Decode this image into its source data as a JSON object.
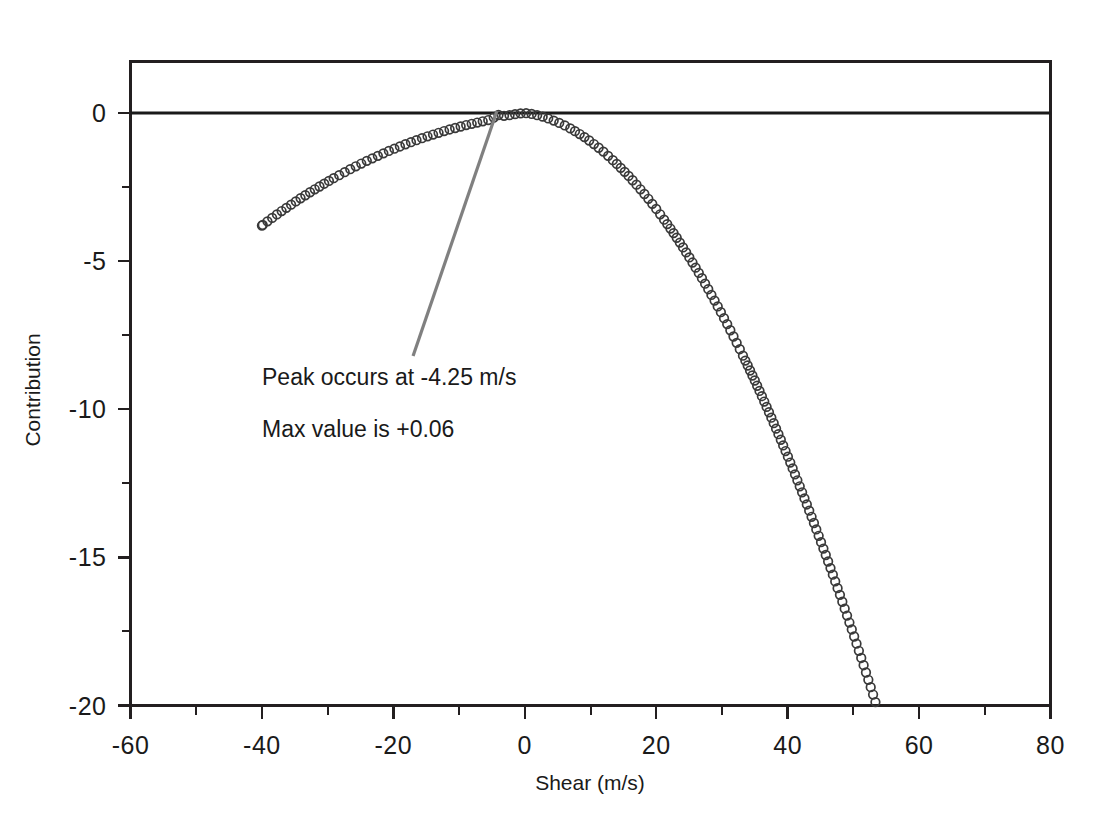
{
  "chart_data": {
    "type": "scatter",
    "title": "",
    "xlabel": "Shear (m/s)",
    "ylabel": "Contribution",
    "xlim": [
      -60,
      80
    ],
    "ylim": [
      -20,
      0.8
    ],
    "grid": false,
    "legend": null,
    "x_ticks": [
      -60,
      -40,
      -20,
      0,
      20,
      40,
      60,
      80
    ],
    "x_tick_labels": [
      "-60",
      "-40",
      "-20",
      "0",
      "20",
      "40",
      "60",
      "80"
    ],
    "x_minor_step": 10,
    "y_ticks": [
      0,
      -5,
      -10,
      -15,
      -20
    ],
    "y_tick_labels": [
      "0",
      "-5",
      "-10",
      "-15",
      "-20"
    ],
    "y_minor_step": 2.5,
    "marker_style": "open-circle",
    "series": [
      {
        "name": "Contribution",
        "x": [
          -40.0,
          -39.0,
          -38.0,
          -37.0,
          -36.0,
          -35.0,
          -34.0,
          -33.0,
          -32.0,
          -31.0,
          -30.0,
          -29.0,
          -28.0,
          -27.0,
          -26.0,
          -25.0,
          -24.0,
          -23.0,
          -22.0,
          -21.0,
          -20.0,
          -19.0,
          -18.0,
          -17.0,
          -16.0,
          -15.0,
          -14.0,
          -13.0,
          -12.0,
          -11.0,
          -10.0,
          -9.0,
          -8.0,
          -7.0,
          -6.0,
          -5.0,
          -4.25,
          -3.0,
          -2.0,
          -1.0,
          0.0,
          1.0,
          2.0,
          3.0,
          4.0,
          5.0,
          6.0,
          7.0,
          8.0,
          9.0,
          10.0,
          11.0,
          12.0,
          13.0,
          14.0,
          15.0,
          16.0,
          17.0,
          18.0,
          19.0,
          20.0,
          21.0,
          22.0,
          23.0,
          24.0,
          25.0,
          26.0,
          27.0,
          28.0,
          29.0,
          30.0,
          31.0,
          32.0,
          33.0,
          34.0,
          35.0,
          36.0,
          37.0,
          38.0,
          39.0,
          40.0,
          41.0,
          42.0,
          43.0,
          44.0,
          45.0,
          46.0,
          47.0,
          48.0,
          49.0,
          50.0,
          51.0,
          52.0,
          53.0,
          54.0,
          55.0,
          56.0,
          57.0,
          58.0,
          59.0,
          60.0,
          61.0,
          62.0,
          63.0,
          64.0,
          65.0,
          66.0,
          67.0,
          68.0,
          69.0,
          70.0,
          71.0
        ],
        "y": [
          -3.8,
          -3.63,
          -3.47,
          -3.31,
          -3.16,
          -3.01,
          -2.86,
          -2.72,
          -2.58,
          -2.45,
          -2.32,
          -2.19,
          -2.07,
          -1.95,
          -1.83,
          -1.72,
          -1.61,
          -1.51,
          -1.41,
          -1.31,
          -1.22,
          -1.13,
          -1.04,
          -0.96,
          -0.88,
          -0.8,
          -0.73,
          -0.66,
          -0.59,
          -0.53,
          -0.47,
          -0.41,
          -0.36,
          -0.31,
          -0.26,
          -0.21,
          -0.06,
          -0.1,
          -0.06,
          -0.02,
          0.0,
          -0.03,
          -0.08,
          -0.14,
          -0.22,
          -0.31,
          -0.41,
          -0.53,
          -0.66,
          -0.8,
          -0.96,
          -1.13,
          -1.31,
          -1.51,
          -1.72,
          -1.94,
          -2.17,
          -2.42,
          -2.68,
          -2.95,
          -3.24,
          -3.54,
          -3.85,
          -4.17,
          -4.51,
          -4.86,
          -5.22,
          -5.59,
          -5.98,
          -6.38,
          -6.79,
          -7.21,
          -7.65,
          -8.1,
          -8.56,
          -9.03,
          -9.52,
          -10.02,
          -10.53,
          -11.05,
          -11.58,
          -12.13,
          -12.69,
          -13.26,
          -13.84,
          -14.44,
          -15.04,
          -15.66,
          -16.29,
          -16.94,
          -17.59,
          -18.26,
          -18.94,
          -19.63,
          -20.34,
          -21.05,
          -21.78,
          -22.52,
          -23.27,
          -24.04,
          -24.81,
          -25.6,
          -26.4,
          -27.21,
          -28.03,
          -28.87,
          -29.71,
          -30.57,
          -31.44,
          -32.32,
          -33.21,
          -34.12
        ]
      }
    ],
    "reference_lines": [
      {
        "name": "zero-line",
        "orientation": "horizontal",
        "value": 0
      }
    ],
    "annotations": [
      {
        "name": "peak-annotation",
        "lines": [
          "Peak occurs at -4.25 m/s",
          "Max value is +0.06"
        ],
        "leader_from": {
          "x": -17.0,
          "y": -8.2
        },
        "leader_to": {
          "x": -4.25,
          "y": 0.06
        }
      }
    ],
    "peak": {
      "x": -4.25,
      "y": 0.06
    }
  },
  "annotation": {
    "line1": "Peak occurs at -4.25 m/s",
    "line2": "Max value is +0.06"
  },
  "axes": {
    "x_title": "Shear (m/s)",
    "y_title": "Contribution"
  },
  "colors": {
    "axis": "#231f20",
    "marker": "#3a3a3a",
    "zero_line": "#1a1a1a",
    "leader": "#808080",
    "background": "#ffffff"
  }
}
